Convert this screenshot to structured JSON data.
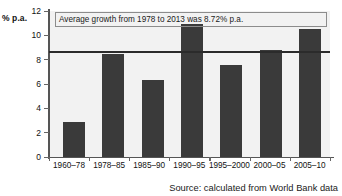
{
  "chart_data": {
    "type": "bar",
    "title": "",
    "xlabel": "",
    "ylabel": "% p.a.",
    "ylim": [
      0,
      12
    ],
    "grid": false,
    "legend": "none",
    "categories": [
      "1960–78",
      "1978–85",
      "1985–90",
      "1990–95",
      "1995–2000",
      "2000–05",
      "2005–10"
    ],
    "values": [
      2.9,
      8.5,
      6.3,
      10.9,
      7.6,
      8.8,
      10.5
    ],
    "yticks": [
      0,
      2,
      4,
      6,
      8,
      10,
      12
    ],
    "ytick_labels": [
      "0",
      "2",
      "4",
      "6",
      "8",
      "10",
      "12"
    ],
    "annotations": [
      {
        "text": "Average growth from 1978 to 2013 was 8.72% p.a.",
        "type": "boxed-text"
      }
    ],
    "reference_line": {
      "name": "average-growth-line",
      "value": 8.72,
      "color": "#2b2b2b"
    },
    "bar_color": "#3a3a3a",
    "plot_background": "#f2f2f2",
    "source_note": "Source: calculated from World Bank data"
  }
}
